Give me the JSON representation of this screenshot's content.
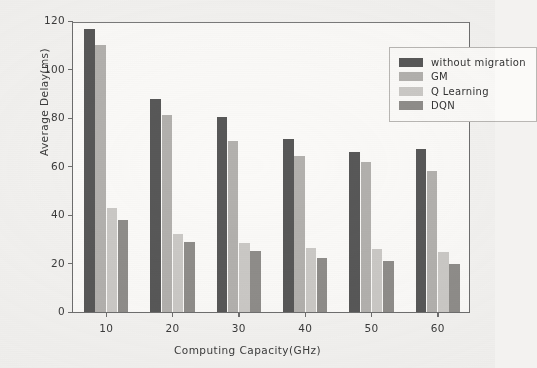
{
  "chart_data": {
    "type": "bar",
    "title": "",
    "xlabel": "Computing Capacity(GHz)",
    "ylabel": "Average Delay(ms)",
    "categories": [
      "10",
      "20",
      "30",
      "40",
      "50",
      "60"
    ],
    "ylim": [
      0,
      120
    ],
    "yticks": [
      "0",
      "20",
      "40",
      "60",
      "80",
      "100",
      "120"
    ],
    "grid": false,
    "legend_position": "top-right",
    "series": [
      {
        "name": "without migration",
        "color": "#585858",
        "values": [
          116.7,
          87.8,
          80.4,
          71.3,
          66.0,
          67.2
        ]
      },
      {
        "name": "GM",
        "color": "#b3b1ae",
        "values": [
          110.0,
          81.2,
          70.5,
          64.3,
          61.9,
          58.1
        ]
      },
      {
        "name": "Q Learning",
        "color": "#cbc9c6",
        "values": [
          42.9,
          32.0,
          28.5,
          26.4,
          26.0,
          24.7
        ]
      },
      {
        "name": "DQN",
        "color": "#8f8d8a",
        "values": [
          38.0,
          28.9,
          25.2,
          22.3,
          21.0,
          19.8
        ]
      }
    ]
  }
}
